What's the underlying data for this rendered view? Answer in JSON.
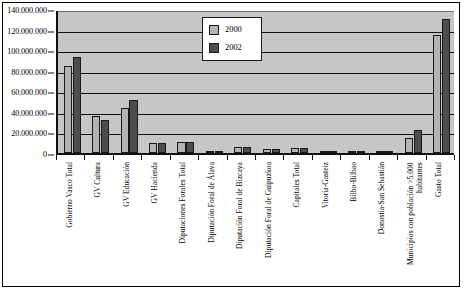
{
  "chart_data": {
    "type": "bar",
    "title": "",
    "xlabel": "",
    "ylabel": "",
    "ylim": [
      0,
      140000000
    ],
    "grid": true,
    "legend_position": "top-center",
    "y_ticks": [
      "0",
      "20.000.000",
      "40.000.000",
      "60.000.000",
      "80.000.000",
      "100.000.000",
      "120.000.000",
      "140.000.000"
    ],
    "y_tick_values": [
      0,
      20000000,
      40000000,
      60000000,
      80000000,
      100000000,
      120000000,
      140000000
    ],
    "categories": [
      "Gobierno Vasco Total",
      "GV Cultura",
      "GV Educación",
      "GV Hacienda",
      "Diputaciones Forales Total",
      "Diputación Foral de Álava",
      "Diputación Foral de Bizcaya",
      "Diputación Foral de Guipuzkoa",
      "Capitales Total",
      "Vitoria-Gasteiz",
      "Bilbo-Bilbao",
      "Donostia-San Sebastián",
      "Municipios con población >5.000 habitantes",
      "Gasto Total"
    ],
    "series": [
      {
        "name": "2000",
        "color": "#b3b3b3",
        "values": [
          85000000,
          36000000,
          44000000,
          10000000,
          11000000,
          1000000,
          6000000,
          4000000,
          4500000,
          1000000,
          800000,
          2200000,
          15000000,
          115000000
        ]
      },
      {
        "name": "2002",
        "color": "#4d4d4d",
        "values": [
          93000000,
          32000000,
          52000000,
          10000000,
          11000000,
          1000000,
          6000000,
          4000000,
          4500000,
          1000000,
          800000,
          2200000,
          22000000,
          130000000
        ]
      }
    ],
    "legend": [
      {
        "label": "2000",
        "color": "#b3b3b3"
      },
      {
        "label": "2002",
        "color": "#4d4d4d"
      }
    ],
    "colors": {
      "plot_background": "#c6c6c6",
      "page_background": "#ffffff",
      "axis": "#111111",
      "series_2000": "#b3b3b3",
      "series_2002": "#4d4d4d"
    }
  }
}
